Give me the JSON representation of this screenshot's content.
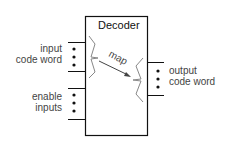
{
  "diagram": {
    "box_title": "Decoder",
    "map_label": "map",
    "inputs": {
      "code_word_line1": "input",
      "code_word_line2": "code word",
      "enable_line1": "enable",
      "enable_line2": "inputs"
    },
    "outputs": {
      "line1": "output",
      "line2": "code word"
    },
    "colors": {
      "box_stroke": "#111111",
      "brace_stroke": "#888888",
      "text": "#444444"
    }
  }
}
